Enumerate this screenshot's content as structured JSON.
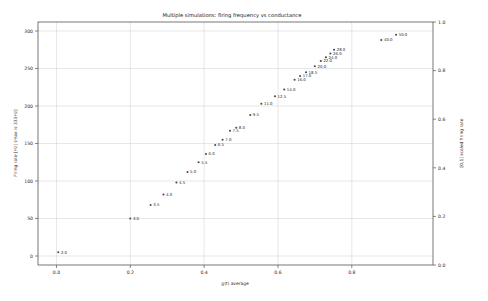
{
  "chart_data": {
    "type": "scatter",
    "title": "Multiple simulations: firing frequency vs conductance",
    "xlabel": "g(t) average",
    "ylabel": "Firing rate [Hz] (max is 333Hz)",
    "ylabel_right": "[0,1] scaled firing rate",
    "xlim": [
      -0.05,
      1.02
    ],
    "ylim": [
      -12,
      312
    ],
    "ylim_right": [
      0.0,
      1.0
    ],
    "grid": true,
    "legend": null,
    "xticks": [
      "0.0",
      "0.2",
      "0.4",
      "0.6",
      "0.8"
    ],
    "xtick_values": [
      0.0,
      0.2,
      0.4,
      0.6,
      0.8
    ],
    "yticks": [
      "0",
      "50",
      "100",
      "150",
      "200",
      "250",
      "300"
    ],
    "ytick_values": [
      0,
      50,
      100,
      150,
      200,
      250,
      300
    ],
    "yticks_right": [
      "0.0",
      "0.2",
      "0.4",
      "0.6",
      "0.8",
      "1.0"
    ],
    "ytick_right_values": [
      0.0,
      0.2,
      0.4,
      0.6,
      0.8,
      1.0
    ],
    "marker_color": "#4a4a4a",
    "points": [
      {
        "label": "2.0",
        "x": 0.005,
        "y": 5
      },
      {
        "label": "3.0",
        "x": 0.2,
        "y": 50
      },
      {
        "label": "3.5",
        "x": 0.255,
        "y": 68
      },
      {
        "label": "4.0",
        "x": 0.29,
        "y": 82
      },
      {
        "label": "4.5",
        "x": 0.325,
        "y": 98
      },
      {
        "label": "5.0",
        "x": 0.355,
        "y": 112
      },
      {
        "label": "5.5",
        "x": 0.385,
        "y": 125
      },
      {
        "label": "6.0",
        "x": 0.405,
        "y": 136
      },
      {
        "label": "6.5",
        "x": 0.43,
        "y": 148
      },
      {
        "label": "7.0",
        "x": 0.45,
        "y": 155
      },
      {
        "label": "7.5",
        "x": 0.47,
        "y": 167
      },
      {
        "label": "8.0",
        "x": 0.487,
        "y": 171
      },
      {
        "label": "9.5",
        "x": 0.525,
        "y": 188
      },
      {
        "label": "11.0",
        "x": 0.555,
        "y": 203
      },
      {
        "label": "12.5",
        "x": 0.592,
        "y": 213
      },
      {
        "label": "14.0",
        "x": 0.617,
        "y": 222
      },
      {
        "label": "16.0",
        "x": 0.645,
        "y": 235
      },
      {
        "label": "17.0",
        "x": 0.66,
        "y": 240
      },
      {
        "label": "18.5",
        "x": 0.676,
        "y": 245
      },
      {
        "label": "20.0",
        "x": 0.7,
        "y": 253
      },
      {
        "label": "22.0",
        "x": 0.716,
        "y": 260
      },
      {
        "label": "24.0",
        "x": 0.73,
        "y": 265
      },
      {
        "label": "26.0",
        "x": 0.742,
        "y": 270
      },
      {
        "label": "28.0",
        "x": 0.752,
        "y": 275
      },
      {
        "label": "40.0",
        "x": 0.88,
        "y": 288
      },
      {
        "label": "50.0",
        "x": 0.92,
        "y": 295
      }
    ]
  }
}
